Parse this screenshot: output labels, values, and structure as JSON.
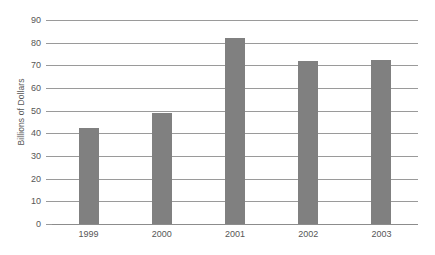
{
  "chart_data": {
    "type": "bar",
    "title": "",
    "subtitle": "",
    "xlabel": "",
    "ylabel": "Billions of Dollars",
    "categories": [
      "1999",
      "2000",
      "2001",
      "2002",
      "2003"
    ],
    "values": [
      42.5,
      49,
      82,
      72,
      72.5
    ],
    "series": [
      {
        "name": "Billions of Dollars",
        "values": [
          42.5,
          49,
          82,
          72,
          72.5
        ]
      }
    ],
    "ylim": [
      0,
      90
    ],
    "ytick_step": 10,
    "yticks": [
      0,
      10,
      20,
      30,
      40,
      50,
      60,
      70,
      80,
      90
    ],
    "ytick_labels": [
      "0",
      "10",
      "20",
      "30",
      "40",
      "50",
      "60",
      "70",
      "80",
      "90"
    ],
    "grid": true,
    "grid_axis": "y",
    "legend": false,
    "legend_position": "none",
    "annotations": [],
    "colors": {
      "bar": "#808080",
      "gridline": "#9a9a9a",
      "axis": "#8c8c8c",
      "text": "#565656",
      "background": "#ffffff"
    }
  }
}
